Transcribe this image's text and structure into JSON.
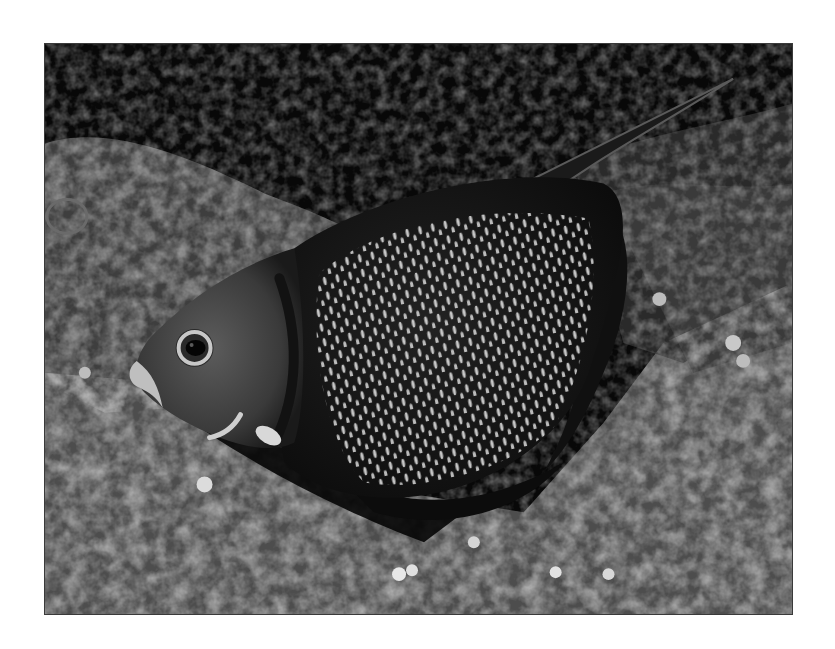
{
  "page": {
    "background": "#ffffff"
  },
  "photo": {
    "subject": "french-angelfish",
    "style": "grayscale",
    "frame": {
      "x": 44,
      "y": 43,
      "width": 749,
      "height": 572,
      "border_color": "#3a3a3a"
    },
    "palette": {
      "reef_dark": "#0a0a0a",
      "reef_mid": "#5a5a5a",
      "reef_light": "#a8a8a8",
      "fish_body": "#151515",
      "fish_face": "#4a4a4a",
      "spot_color": "#e8e8e8",
      "eye_ring": "#bdbdbd"
    }
  }
}
